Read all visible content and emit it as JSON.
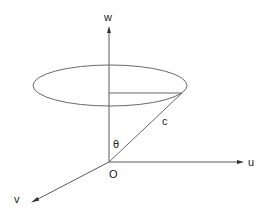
{
  "diagram": {
    "title": "",
    "colors": {
      "background": "#ffffff",
      "lines": "#5a5a5a",
      "text": "#222222"
    },
    "labels": {
      "w_axis": "w",
      "u_axis": "u",
      "v_axis": "v",
      "origin": "O",
      "slant": "c",
      "angle": "θ"
    },
    "geometry": {
      "origin": {
        "x": 109,
        "y": 162
      },
      "w_axis_end": {
        "x": 109,
        "y": 27
      },
      "u_axis_end": {
        "x": 243,
        "y": 162
      },
      "v_axis_end": {
        "x": 32,
        "y": 202
      },
      "ellipse": {
        "cx": 110,
        "cy": 85.5,
        "rx": 77,
        "ry": 20.5
      },
      "radius_line": {
        "x1": 109,
        "y1": 93,
        "x2": 182,
        "y2": 93
      },
      "slant_line": {
        "x1": 109,
        "y1": 162,
        "x2": 182,
        "y2": 93
      }
    }
  }
}
